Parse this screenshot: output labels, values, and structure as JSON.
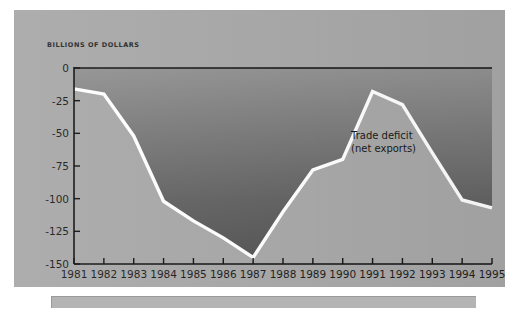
{
  "chart_data": {
    "type": "area",
    "title": "",
    "subtitle": "",
    "ylabel": "BILLIONS OF DOLLARS",
    "xlabel": "",
    "categories": [
      1981,
      1982,
      1983,
      1984,
      1985,
      1986,
      1987,
      1988,
      1989,
      1990,
      1991,
      1992,
      1993,
      1994,
      1995
    ],
    "tick_labels_x": [
      "1981",
      "1982",
      "1983",
      "1984",
      "1985",
      "1986",
      "1987",
      "1988",
      "1989",
      "1990",
      "1991",
      "1992",
      "1993",
      "1994",
      "1995"
    ],
    "tick_labels_y": [
      "0",
      "-25",
      "-50",
      "-75",
      "-100",
      "-125",
      "-150"
    ],
    "tick_values_y": [
      0,
      -25,
      -50,
      -75,
      -100,
      -125,
      -150
    ],
    "ylim": [
      -150,
      0
    ],
    "xlim": [
      1981,
      1995
    ],
    "grid": false,
    "legend": "none",
    "series": [
      {
        "name": "Trade deficit (net exports)",
        "values": [
          -16,
          -20,
          -52,
          -102,
          -117,
          -130,
          -145,
          -110,
          -78,
          -70,
          -18,
          -28,
          -65,
          -101,
          -107
        ]
      }
    ],
    "annotations": [
      {
        "name": "series-label",
        "line1": "Trade deficit",
        "line2": "(net exports)"
      }
    ],
    "style": {
      "panel_color": "#a9a9a9",
      "fill_top_color": "#8f8f8f",
      "fill_bottom_color": "#5a5a5a",
      "line_color": "#ffffff",
      "axis_color": "#1a1a1a",
      "caption_bar_color": "#b4b4b4",
      "background_color": "#ffffff"
    }
  },
  "annotation": {
    "line1": "Trade deficit",
    "line2": "(net exports)"
  }
}
